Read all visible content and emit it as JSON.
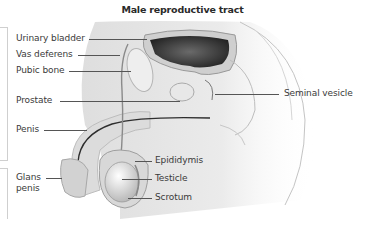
{
  "diagram": {
    "title": "Male reproductive tract",
    "labels_left": [
      {
        "id": "urinary-bladder",
        "text": "Urinary bladder"
      },
      {
        "id": "vas-deferens",
        "text": "Vas deferens"
      },
      {
        "id": "pubic-bone",
        "text": "Pubic bone"
      },
      {
        "id": "prostate",
        "text": "Prostate"
      },
      {
        "id": "penis",
        "text": "Penis"
      },
      {
        "id": "glans-penis",
        "text": "Glans\npenis",
        "line1": "Glans",
        "line2": "penis"
      }
    ],
    "labels_right": [
      {
        "id": "seminal-vesicle",
        "text": "Seminal vesicle"
      },
      {
        "id": "epididymis",
        "text": "Epididymis"
      },
      {
        "id": "testicle",
        "text": "Testicle"
      },
      {
        "id": "scrotum",
        "text": "Scrotum"
      }
    ],
    "colors": {
      "background": "#ffffff",
      "tissue_light": "#e9e9e9",
      "tissue_mid": "#c8c8c8",
      "tissue_dark": "#3a3a3a",
      "leader_line": "#555555",
      "text": "#3a3a3a"
    }
  }
}
